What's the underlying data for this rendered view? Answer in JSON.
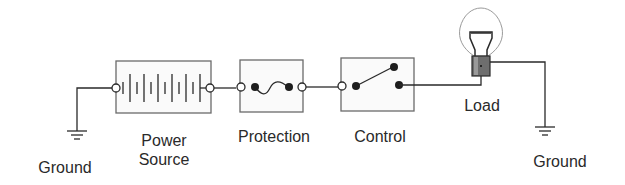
{
  "diagram": {
    "type": "series circuit block diagram",
    "colors": {
      "wire": "#2a2a2a",
      "box_border": "#6a6a6a",
      "terminal_fill": "#ffffff",
      "contact_fill": "#1e1e1e",
      "bulb_glass": "#9a9a9a",
      "bulb_base": "#6e6e6e"
    },
    "components": [
      {
        "id": "ground-left",
        "label": "Ground"
      },
      {
        "id": "power-source",
        "label": "Power\nSource"
      },
      {
        "id": "protection",
        "label": "Protection"
      },
      {
        "id": "control",
        "label": "Control"
      },
      {
        "id": "load",
        "label": "Load"
      },
      {
        "id": "ground-right",
        "label": "Ground"
      }
    ]
  }
}
